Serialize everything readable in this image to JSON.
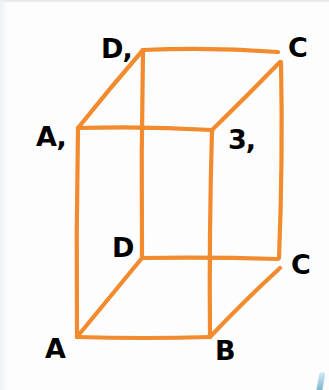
{
  "figure": {
    "type": "rectangular-parallelepiped",
    "colors": {
      "edge": "#f28a2e",
      "label": "#111111",
      "background": "#fdfdfd"
    },
    "vertices": {
      "D1": {
        "x": 143,
        "y": 50
      },
      "C1": {
        "x": 280,
        "y": 55
      },
      "A1": {
        "x": 78,
        "y": 128
      },
      "B1": {
        "x": 212,
        "y": 130
      },
      "D": {
        "x": 142,
        "y": 258
      },
      "C": {
        "x": 278,
        "y": 262
      },
      "A": {
        "x": 77,
        "y": 337
      },
      "B": {
        "x": 210,
        "y": 337
      }
    },
    "labels": {
      "D1": "D,",
      "C1": "C",
      "A1": "A,",
      "B1": "3,",
      "D": "D",
      "C": "C",
      "A": "A",
      "B": "B"
    },
    "edges": [
      [
        "D1",
        "C1"
      ],
      [
        "A1",
        "B1"
      ],
      [
        "A1",
        "D1"
      ],
      [
        "B1",
        "C1"
      ],
      [
        "A",
        "B"
      ],
      [
        "D",
        "C"
      ],
      [
        "A",
        "D"
      ],
      [
        "B",
        "C"
      ],
      [
        "A1",
        "A"
      ],
      [
        "B1",
        "B"
      ],
      [
        "D1",
        "D"
      ],
      [
        "C1",
        "C"
      ]
    ]
  }
}
